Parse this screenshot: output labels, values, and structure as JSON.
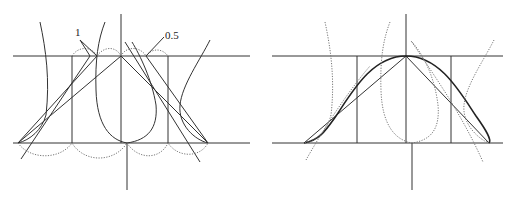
{
  "figure": {
    "left_panel": {
      "labels": [
        {
          "text": "1",
          "x": 75,
          "y": 36
        },
        {
          "text": "0.5",
          "x": 165,
          "y": 39
        }
      ]
    },
    "right_panel": {
      "labels": []
    }
  }
}
